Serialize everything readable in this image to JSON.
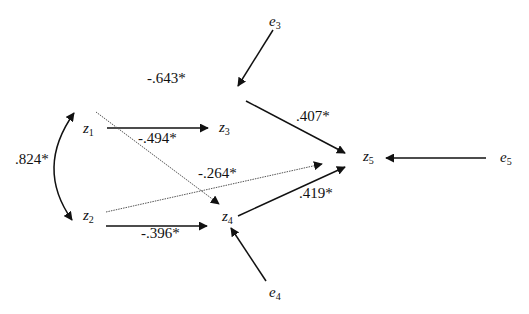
{
  "nodes": {
    "z1": {
      "name": "z",
      "sub": "1"
    },
    "z2": {
      "name": "z",
      "sub": "2"
    },
    "z3": {
      "name": "z",
      "sub": "3"
    },
    "z4": {
      "name": "z",
      "sub": "4"
    },
    "z5": {
      "name": "z",
      "sub": "5"
    },
    "e3": {
      "name": "e",
      "sub": "3"
    },
    "e4": {
      "name": "e",
      "sub": "4"
    },
    "e5": {
      "name": "e",
      "sub": "5"
    }
  },
  "paths": {
    "z1_z2_covariance": ".824*",
    "z1_z3": "-.643*",
    "z1_z4": "-.494*",
    "z2_z5": "-.264*",
    "z2_z4": "-.396*",
    "z3_z5": ".407*",
    "z4_z5": ".419*"
  },
  "colors": {
    "line": "#111111",
    "dotted": "#555555"
  }
}
